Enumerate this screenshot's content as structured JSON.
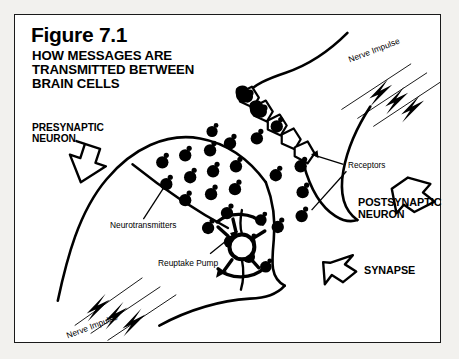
{
  "figure": {
    "number": "Figure 7.1",
    "title": "HOW MESSAGES ARE\nTRANSMITTED BETWEEN\nBRAIN CELLS",
    "background_color": "#ffffff",
    "page_color": "#f2f1ee",
    "ink_color": "#000000"
  },
  "labels": {
    "presynaptic": "PRESYNAPTIC\nNEURON",
    "postsynaptic": "POSTSYNAPTIC\nNEURON",
    "synapse": "SYNAPSE",
    "neurotransmitters": "Neurotransmitters",
    "reuptake_pump": "Reuptake Pump",
    "receptors": "Receptors",
    "nerve_impulse_top": "Nerve Impulse",
    "nerve_impulse_bottom": "Nerve Impulse"
  },
  "diagram": {
    "neurotransmitter_count": 26,
    "receptor_count": 5,
    "lightning_bolt_groups": 2,
    "bolts_per_group": 3,
    "callout_arrows": [
      "presynaptic-arrow",
      "postsynaptic-arrow",
      "synapse-arrow"
    ],
    "leader_lines": [
      "neurotransmitters",
      "reuptake-pump",
      "receptors"
    ]
  }
}
